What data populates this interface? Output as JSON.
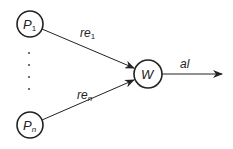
{
  "diagram": {
    "nodes": [
      {
        "id": "p1",
        "label": "P",
        "subscript": "1",
        "cx": 30,
        "cy": 24,
        "r": 13
      },
      {
        "id": "pn",
        "label": "P",
        "subscript": "n",
        "cx": 30,
        "cy": 125,
        "r": 13
      },
      {
        "id": "w",
        "label": "W",
        "cx": 148,
        "cy": 74,
        "r": 14
      }
    ],
    "edges": [
      {
        "from": "p1",
        "to": "w",
        "label": "re",
        "subscript": "1"
      },
      {
        "from": "pn",
        "to": "w",
        "label": "re",
        "subscript": "n"
      },
      {
        "from": "w",
        "to": "out",
        "label": "al"
      }
    ],
    "ellipsis_dots": 4,
    "colors": {
      "stroke": "#222222",
      "background": "#ffffff"
    }
  },
  "labels": {
    "p1_main": "P",
    "p1_sub": "1",
    "pn_main": "P",
    "pn_sub": "n",
    "w": "W",
    "re1_main": "re",
    "re1_sub": "1",
    "ren_main": "re",
    "ren_sub": "n",
    "al": "al"
  }
}
